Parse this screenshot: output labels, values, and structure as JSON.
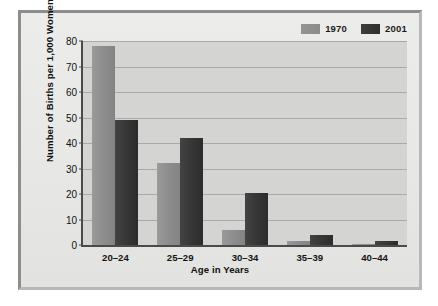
{
  "chart_data": {
    "type": "bar",
    "title": "",
    "xlabel": "Age in Years",
    "ylabel": "Number of Births per 1,000 Women",
    "categories": [
      "20–24",
      "25–29",
      "30–34",
      "35–39",
      "40–44"
    ],
    "series": [
      {
        "name": "1970",
        "color": "#8c8c8c",
        "values": [
          78,
          32,
          6,
          1.5,
          0.5
        ]
      },
      {
        "name": "2001",
        "color": "#353535",
        "values": [
          49,
          42,
          20.5,
          4,
          1.5
        ]
      }
    ],
    "ylim": [
      0,
      80
    ],
    "yticks": [
      0,
      10,
      20,
      30,
      40,
      50,
      60,
      70,
      80
    ],
    "ytick_labels": [
      "0",
      "10",
      "20",
      "30",
      "40",
      "50",
      "60",
      "70",
      "80"
    ],
    "grid": true,
    "legend_position": "top-right",
    "legend": [
      "1970",
      "2001"
    ]
  }
}
